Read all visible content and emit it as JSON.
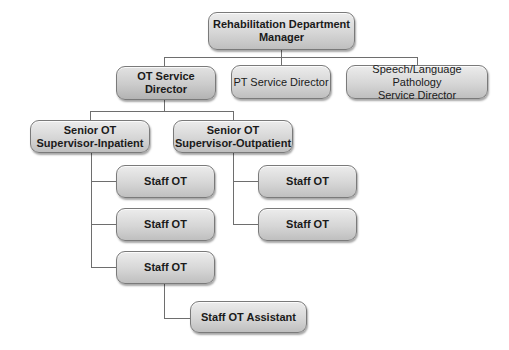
{
  "diagram": {
    "type": "org-chart",
    "nodes": {
      "manager": "Rehabilitation Department\nManager",
      "ot_director": "OT Service\nDirector",
      "pt_director": "PT Service Director",
      "slp_director": "Speech/Language Pathology\nService Director",
      "senior_inpatient": "Senior OT\nSupervisor-Inpatient",
      "senior_outpatient": "Senior OT\nSupervisor-Outpatient",
      "staff_in_1": "Staff OT",
      "staff_in_2": "Staff OT",
      "staff_in_3": "Staff OT",
      "staff_out_1": "Staff OT",
      "staff_out_2": "Staff OT",
      "assistant": "Staff OT Assistant"
    },
    "edges": [
      [
        "manager",
        "ot_director"
      ],
      [
        "manager",
        "pt_director"
      ],
      [
        "manager",
        "slp_director"
      ],
      [
        "ot_director",
        "senior_inpatient"
      ],
      [
        "ot_director",
        "senior_outpatient"
      ],
      [
        "senior_inpatient",
        "staff_in_1"
      ],
      [
        "senior_inpatient",
        "staff_in_2"
      ],
      [
        "senior_inpatient",
        "staff_in_3"
      ],
      [
        "senior_outpatient",
        "staff_out_1"
      ],
      [
        "senior_outpatient",
        "staff_out_2"
      ],
      [
        "staff_in_3",
        "assistant"
      ]
    ]
  }
}
